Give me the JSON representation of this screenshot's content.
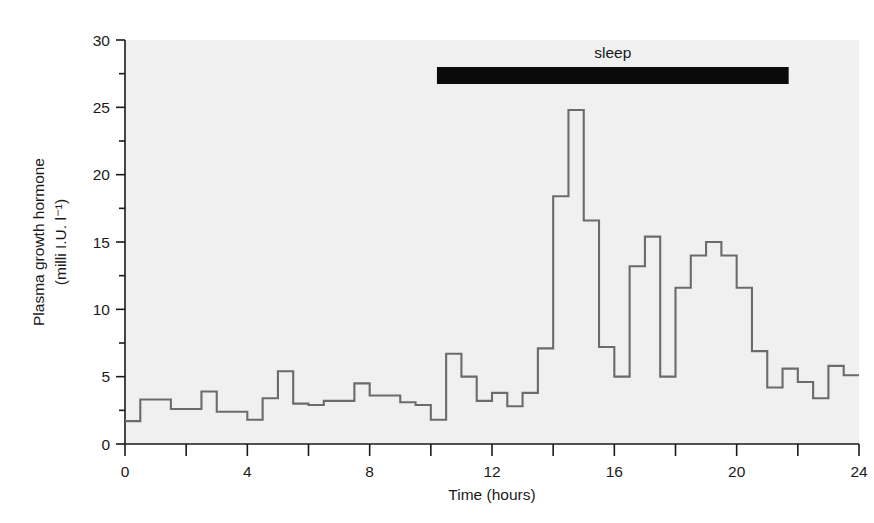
{
  "chart_data": {
    "type": "line",
    "subtype": "step",
    "title": "",
    "xlabel": "Time (hours)",
    "ylabel": "Plasma growth hormone (milli I.U. l⁻¹)",
    "ylabel_line1": "Plasma growth hormone",
    "ylabel_line2": "(milli I.U. l⁻¹)",
    "xlim": [
      0,
      24
    ],
    "ylim": [
      0,
      30
    ],
    "xticks": [
      0,
      4,
      8,
      12,
      16,
      20,
      24
    ],
    "xtick_labels": [
      "0",
      "4",
      "8",
      "12",
      "16",
      "20",
      "24"
    ],
    "xticks_minor": [
      2,
      6,
      10,
      14,
      18,
      22
    ],
    "yticks": [
      0,
      5,
      10,
      15,
      20,
      25,
      30
    ],
    "ytick_labels": [
      "0",
      "5",
      "10",
      "15",
      "20",
      "25",
      "30"
    ],
    "yticks_minor": [
      2.5,
      7.5,
      12.5,
      17.5,
      22.5,
      27.5
    ],
    "grid": false,
    "legend": false,
    "series_name": "Plasma growth hormone",
    "line_color": "#6b6b6b",
    "plot_background": "#f0f0f0",
    "page_background": "#ffffff",
    "axis_color": "#1a1a1a",
    "annotations": [
      {
        "name": "sleep",
        "label": "sleep",
        "type": "span-bar",
        "x_start": 10.2,
        "x_end": 21.7,
        "y_level": 27.4,
        "color": "#0a0a0a"
      }
    ],
    "x": [
      0.0,
      0.5,
      1.0,
      1.5,
      2.0,
      2.5,
      3.0,
      3.5,
      4.0,
      4.5,
      5.0,
      5.5,
      6.0,
      6.5,
      7.0,
      7.5,
      8.0,
      8.5,
      9.0,
      9.5,
      10.0,
      10.5,
      11.0,
      11.5,
      12.0,
      12.5,
      13.0,
      13.5,
      14.0,
      14.5,
      15.0,
      15.5,
      16.0,
      16.5,
      17.0,
      17.5,
      18.0,
      18.5,
      19.0,
      19.5,
      20.0,
      20.5,
      21.0,
      21.5,
      22.0,
      22.5,
      23.0,
      23.5
    ],
    "values": [
      1.7,
      3.3,
      3.3,
      2.6,
      2.6,
      3.9,
      2.4,
      2.4,
      1.8,
      3.4,
      5.4,
      3.0,
      2.9,
      3.2,
      3.2,
      4.5,
      3.6,
      3.6,
      3.1,
      2.9,
      1.8,
      6.7,
      5.0,
      3.2,
      3.8,
      2.8,
      3.8,
      7.1,
      18.4,
      24.8,
      16.6,
      7.2,
      5.0,
      13.2,
      15.4,
      5.0,
      11.6,
      14.0,
      15.0,
      14.0,
      11.6,
      6.9,
      4.2,
      5.6,
      4.6,
      3.4,
      5.8,
      5.1
    ]
  }
}
